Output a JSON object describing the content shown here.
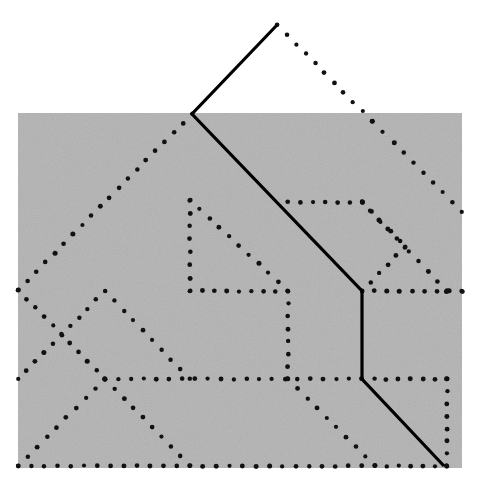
{
  "figure": {
    "canvas": {
      "width": 488,
      "height": 488,
      "background": "#ffffff"
    },
    "noise_panel": {
      "name": "gray-noise-rectangle",
      "x": 18,
      "y": 113,
      "width": 444,
      "height": 355,
      "fill": "#b3b3b3",
      "noise_opacity": 0.22,
      "noise_seed": 7
    },
    "styles": {
      "solid": {
        "color": "#000000",
        "width": 3.2
      },
      "dotted": {
        "color": "#111111",
        "dot_radius": 2.3,
        "spacing": 13
      }
    },
    "solid_path": {
      "name": "solid-lattice-path",
      "points": [
        [
          277,
          25
        ],
        [
          192,
          114
        ],
        [
          362,
          291
        ],
        [
          362,
          379
        ],
        [
          444,
          466
        ]
      ]
    },
    "dotted_paths": [
      {
        "name": "dotted-path-upper-right-descender",
        "points": [
          [
            277,
            25
          ],
          [
            372,
            121
          ],
          [
            394,
            143
          ],
          [
            462,
            212
          ]
        ]
      },
      {
        "name": "dotted-path-upper-left-descender",
        "points": [
          [
            192,
            114
          ],
          [
            18,
            290
          ]
        ]
      },
      {
        "name": "dotted-path-inner-peak",
        "points": [
          [
            190,
            200
          ],
          [
            190,
            291
          ],
          [
            288,
            291
          ]
        ]
      },
      {
        "name": "dotted-path-inner-peak-right-leg",
        "points": [
          [
            190,
            200
          ],
          [
            288,
            291
          ],
          [
            288,
            379
          ]
        ]
      },
      {
        "name": "dotted-path-mid-horizontal-upper",
        "points": [
          [
            288,
            202
          ],
          [
            362,
            202
          ],
          [
            447,
            291
          ]
        ]
      },
      {
        "name": "dotted-path-mid-right-zigzag",
        "points": [
          [
            362,
            202
          ],
          [
            405,
            247
          ],
          [
            362,
            291
          ]
        ]
      },
      {
        "name": "dotted-path-right-upper-diagonal",
        "points": [
          [
            447,
            291
          ],
          [
            462,
            291
          ]
        ]
      },
      {
        "name": "dotted-path-horizontal-y291",
        "points": [
          [
            362,
            291
          ],
          [
            462,
            291
          ]
        ]
      },
      {
        "name": "dotted-path-horizontal-y379",
        "points": [
          [
            105,
            379
          ],
          [
            362,
            379
          ]
        ]
      },
      {
        "name": "dotted-path-horizontal-y379-right",
        "points": [
          [
            362,
            379
          ],
          [
            447,
            379
          ]
        ]
      },
      {
        "name": "dotted-path-right-vertical",
        "points": [
          [
            447,
            379
          ],
          [
            447,
            466
          ]
        ]
      },
      {
        "name": "dotted-path-left-upper-v",
        "points": [
          [
            18,
            290
          ],
          [
            105,
            379
          ]
        ]
      },
      {
        "name": "dotted-path-left-zigzag-a",
        "points": [
          [
            105,
            291
          ],
          [
            18,
            379
          ]
        ]
      },
      {
        "name": "dotted-path-left-zigzag-b",
        "points": [
          [
            105,
            291
          ],
          [
            190,
            379
          ]
        ]
      },
      {
        "name": "dotted-path-left-zigzag-c",
        "points": [
          [
            105,
            379
          ],
          [
            18,
            466
          ]
        ]
      },
      {
        "name": "dotted-path-left-zigzag-d",
        "points": [
          [
            105,
            379
          ],
          [
            190,
            466
          ]
        ]
      },
      {
        "name": "dotted-path-mid-lower-diagonal",
        "points": [
          [
            288,
            379
          ],
          [
            375,
            466
          ]
        ]
      },
      {
        "name": "dotted-path-bottom-horizontal",
        "points": [
          [
            18,
            466
          ],
          [
            375,
            466
          ]
        ]
      },
      {
        "name": "dotted-path-bottom-horizontal-right",
        "points": [
          [
            375,
            466
          ],
          [
            447,
            466
          ]
        ]
      }
    ]
  }
}
